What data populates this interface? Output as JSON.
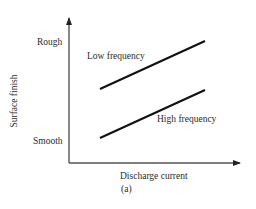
{
  "figure": {
    "caption": "(a)",
    "x_axis": {
      "label": "Discharge current"
    },
    "y_axis": {
      "label": "Surface finish",
      "ticks": {
        "top": "Rough",
        "bottom": "Smooth"
      }
    },
    "series": [
      {
        "name": "Low frequency",
        "label": "Low frequency",
        "start": [
          100,
          89
        ],
        "end": [
          205,
          41
        ]
      },
      {
        "name": "High frequency",
        "label": "High frequency",
        "start": [
          100,
          138
        ],
        "end": [
          205,
          90
        ]
      }
    ],
    "colors": {
      "axis": "#555555",
      "line": "#111111",
      "text": "#2a2a2a"
    }
  }
}
